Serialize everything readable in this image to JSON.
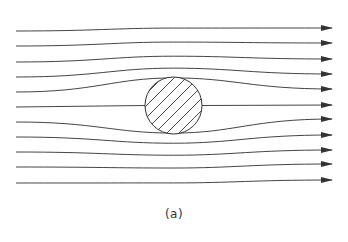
{
  "figure": {
    "caption": "(a)",
    "line_color": "#333333",
    "cylinder": {
      "cx": 173.5,
      "cy": 105.5,
      "r": 28.5,
      "fill": "hatched"
    },
    "streamlines": [
      {
        "y_in": 31,
        "y_out": 28
      },
      {
        "y_in": 46,
        "y_out": 43
      },
      {
        "y_in": 62,
        "y_out": 59
      },
      {
        "y_in": 77,
        "y_out": 74
      },
      {
        "y_in": 92,
        "y_out": 89
      },
      {
        "y_in": 107,
        "y_out": 105
      },
      {
        "y_in": 122,
        "y_out": 119
      },
      {
        "y_in": 137,
        "y_out": 135
      },
      {
        "y_in": 152,
        "y_out": 150
      },
      {
        "y_in": 167,
        "y_out": 164
      },
      {
        "y_in": 183,
        "y_out": 180
      }
    ]
  }
}
